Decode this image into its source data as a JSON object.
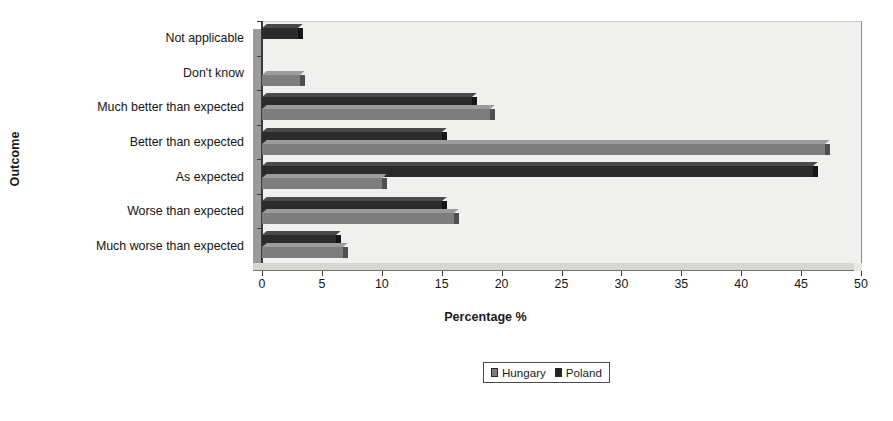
{
  "chart_data": {
    "type": "bar",
    "orientation": "horizontal",
    "title": "",
    "xlabel": "Percentage %",
    "ylabel": "Outcome",
    "xlim": [
      0,
      50
    ],
    "xticks": [
      0,
      5,
      10,
      15,
      20,
      25,
      30,
      35,
      40,
      45,
      50
    ],
    "xtick_labels": [
      "0",
      "5",
      "10",
      "15",
      "20",
      "25",
      "30",
      "35",
      "40",
      "45",
      "50"
    ],
    "grid": false,
    "legend_position": "bottom-center",
    "categories": [
      "Not applicable",
      "Don't know",
      "Much better than expected",
      "Better than expected",
      "As expected",
      "Worse than expected",
      "Much worse than expected"
    ],
    "series": [
      {
        "name": "Hungary",
        "color": "#7d7d7d",
        "values": [
          0,
          3.2,
          19,
          47,
          10,
          16,
          6.8
        ]
      },
      {
        "name": "Poland",
        "color": "#2b2b2b",
        "values": [
          3,
          0,
          17.5,
          15,
          46,
          15,
          6.2
        ]
      }
    ]
  },
  "legend": {
    "items": [
      {
        "label": "Hungary",
        "swatch": "hungary"
      },
      {
        "label": "Poland",
        "swatch": "poland"
      }
    ]
  }
}
